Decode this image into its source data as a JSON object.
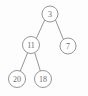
{
  "figure": {
    "background_color": "#fdfdfd",
    "node_fill_color": "#ffffff",
    "node_stroke_color": "#8a8a8a",
    "edge_color": "#8a8a8a",
    "label_color": "#6b6b6b"
  },
  "tree": {
    "root_id": "n3",
    "nodes": [
      {
        "id": "n3",
        "label": "3",
        "cx": 50,
        "cy": 14,
        "r": 8
      },
      {
        "id": "n11",
        "label": "11",
        "cx": 31,
        "cy": 45,
        "r": 8.5
      },
      {
        "id": "n7",
        "label": "7",
        "cx": 68,
        "cy": 46,
        "r": 8
      },
      {
        "id": "n20",
        "label": "20",
        "cx": 17,
        "cy": 79,
        "r": 8.5
      },
      {
        "id": "n18",
        "label": "18",
        "cx": 43,
        "cy": 79,
        "r": 8.5
      }
    ],
    "edges": [
      {
        "id": "e1",
        "from": "n3",
        "to": "n11",
        "x1": 44.7,
        "y1": 20.0,
        "x2": 36.0,
        "y2": 39.2
      },
      {
        "id": "e2",
        "from": "n3",
        "to": "n7",
        "x1": 55.5,
        "y1": 20.0,
        "x2": 63.4,
        "y2": 39.5
      },
      {
        "id": "e3",
        "from": "n11",
        "to": "n20",
        "x1": 27.6,
        "y1": 52.8,
        "x2": 20.2,
        "y2": 71.2
      },
      {
        "id": "e4",
        "from": "n11",
        "to": "n18",
        "x1": 34.8,
        "y1": 52.9,
        "x2": 40.4,
        "y2": 71.1
      }
    ]
  },
  "chart_data": {
    "type": "diagram",
    "node_values": [
      3,
      11,
      7,
      20,
      18
    ],
    "structure": {
      "value": 3,
      "left": {
        "value": 11,
        "left": {
          "value": 20,
          "left": null,
          "right": null
        },
        "right": {
          "value": 18,
          "left": null,
          "right": null
        }
      },
      "right": {
        "value": 7,
        "left": null,
        "right": null
      }
    },
    "levels": [
      {
        "depth": 0,
        "values": [
          3
        ]
      },
      {
        "depth": 1,
        "values": [
          11,
          7
        ]
      },
      {
        "depth": 2,
        "values": [
          20,
          18
        ]
      }
    ]
  }
}
